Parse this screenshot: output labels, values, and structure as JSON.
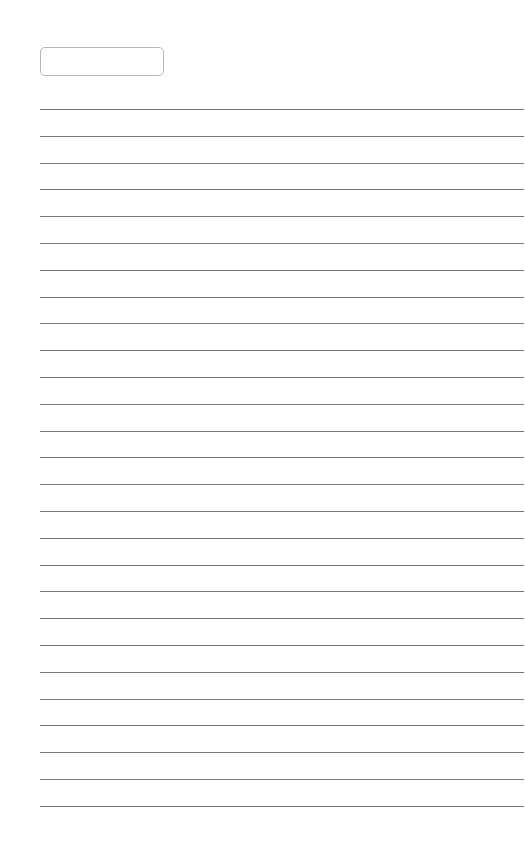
{
  "page": {
    "type": "lined-paper",
    "name_box": {
      "text": ""
    },
    "lines": {
      "count": 27,
      "first_y": 109,
      "spacing": 26.8,
      "color": "#7a7a7a"
    }
  }
}
